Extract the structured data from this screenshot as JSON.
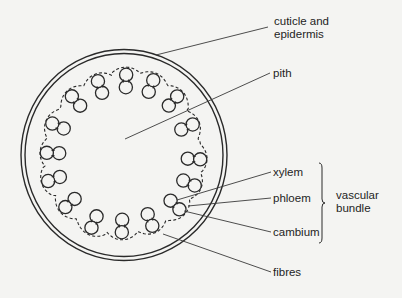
{
  "diagram": {
    "colors": {
      "background": "#f4f4f2",
      "ink": "#2a2a2a"
    },
    "stem": {
      "center": [
        124,
        155
      ],
      "outer_rx": 103,
      "outer_ry": 105.5,
      "inner_rx": 99,
      "inner_ry": 101.5
    },
    "bundles": [
      {
        "x": 126,
        "y": 81
      },
      {
        "x": 151,
        "y": 86
      },
      {
        "x": 173,
        "y": 101
      },
      {
        "x": 187,
        "y": 127
      },
      {
        "x": 194,
        "y": 159
      },
      {
        "x": 189,
        "y": 183
      },
      {
        "x": 175,
        "y": 205
      },
      {
        "x": 150,
        "y": 220
      },
      {
        "x": 122,
        "y": 226
      },
      {
        "x": 94,
        "y": 222
      },
      {
        "x": 70,
        "y": 203
      },
      {
        "x": 54,
        "y": 179
      },
      {
        "x": 53,
        "y": 153
      },
      {
        "x": 58,
        "y": 126
      },
      {
        "x": 76,
        "y": 101
      },
      {
        "x": 100,
        "y": 87
      }
    ],
    "labels": [
      {
        "id": "cuticle",
        "lines": [
          "cuticle and",
          "epidermis"
        ],
        "x": 274,
        "y": 25,
        "from": [
          156,
          55
        ],
        "to": [
          268,
          27
        ]
      },
      {
        "id": "pith",
        "lines": [
          "pith"
        ],
        "x": 273,
        "y": 77,
        "from": [
          125,
          139
        ],
        "to": [
          270,
          73
        ]
      },
      {
        "id": "xylem",
        "lines": [
          "xylem"
        ],
        "x": 273,
        "y": 176,
        "from": [
          177,
          200
        ],
        "to": [
          271,
          172
        ]
      },
      {
        "id": "phloem",
        "lines": [
          "phloem"
        ],
        "x": 273,
        "y": 202,
        "from": [
          188,
          206
        ],
        "to": [
          271,
          198
        ]
      },
      {
        "id": "cambium",
        "lines": [
          "cambium"
        ],
        "x": 273,
        "y": 236,
        "from": [
          184,
          211
        ],
        "to": [
          271,
          232
        ]
      },
      {
        "id": "fibres",
        "lines": [
          "fibres"
        ],
        "x": 273,
        "y": 276,
        "from": [
          163,
          234
        ],
        "to": [
          271,
          272
        ]
      }
    ],
    "group_label": {
      "lines": [
        "vascular",
        "bundle"
      ],
      "x": 336,
      "y": 199,
      "brace": {
        "x": 322,
        "top": 163,
        "bottom": 243
      }
    }
  }
}
